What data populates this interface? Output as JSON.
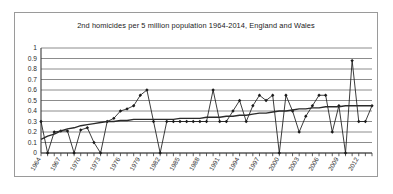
{
  "chart_data": {
    "type": "line",
    "title": "2nd homicides per 5 million population 1964-2014, England and Wales",
    "xlabel": "",
    "ylabel": "",
    "ylim": [
      0,
      1
    ],
    "yticks": [
      "0",
      "0.1",
      "0.2",
      "0.3",
      "0.4",
      "0.5",
      "0.6",
      "0.7",
      "0.8",
      "0.9",
      "1"
    ],
    "grid": true,
    "legend": "none",
    "x_start": 1964,
    "x_end": 2014,
    "xtick_step": 3,
    "xtick_labels": [
      "1964",
      "1967",
      "1970",
      "1973",
      "1976",
      "1979",
      "1982",
      "1985",
      "1988",
      "1991",
      "1994",
      "1997",
      "2000",
      "2003",
      "2006",
      "2009",
      "2012"
    ],
    "x": [
      1964,
      1965,
      1966,
      1967,
      1968,
      1969,
      1970,
      1971,
      1972,
      1973,
      1974,
      1975,
      1976,
      1977,
      1978,
      1979,
      1980,
      1981,
      1982,
      1983,
      1984,
      1985,
      1986,
      1987,
      1988,
      1989,
      1990,
      1991,
      1992,
      1993,
      1994,
      1995,
      1996,
      1997,
      1998,
      1999,
      2000,
      2001,
      2002,
      2003,
      2004,
      2005,
      2006,
      2007,
      2008,
      2009,
      2010,
      2011,
      2012,
      2013,
      2014
    ],
    "series": [
      {
        "name": "2nd homicides per 5 million population",
        "color": "#1a1a1a",
        "marker": "diamond",
        "values": [
          0.3,
          0.0,
          0.2,
          0.21,
          0.21,
          0.0,
          0.22,
          0.24,
          0.1,
          0.0,
          0.3,
          0.33,
          0.4,
          0.42,
          0.45,
          0.55,
          0.6,
          0.3,
          0.0,
          0.3,
          0.3,
          0.3,
          0.3,
          0.3,
          0.3,
          0.3,
          0.6,
          0.3,
          0.3,
          0.4,
          0.5,
          0.3,
          0.45,
          0.55,
          0.5,
          0.55,
          0.0,
          0.55,
          0.4,
          0.2,
          0.35,
          0.45,
          0.55,
          0.55,
          0.2,
          0.45,
          0.0,
          0.88,
          0.3,
          0.3,
          0.45
        ]
      },
      {
        "name": "trend line",
        "color": "#2b2b2b",
        "marker": "none",
        "values": [
          0.13,
          0.16,
          0.18,
          0.21,
          0.23,
          0.24,
          0.26,
          0.27,
          0.28,
          0.29,
          0.3,
          0.3,
          0.31,
          0.31,
          0.32,
          0.32,
          0.32,
          0.32,
          0.32,
          0.32,
          0.32,
          0.33,
          0.33,
          0.33,
          0.33,
          0.34,
          0.34,
          0.34,
          0.35,
          0.35,
          0.36,
          0.36,
          0.37,
          0.38,
          0.38,
          0.39,
          0.4,
          0.4,
          0.41,
          0.42,
          0.42,
          0.43,
          0.43,
          0.44,
          0.44,
          0.44,
          0.45,
          0.45,
          0.45,
          0.45,
          0.45
        ]
      }
    ]
  }
}
